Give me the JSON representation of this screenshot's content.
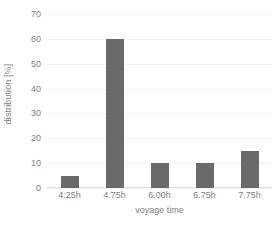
{
  "chart_data": {
    "type": "bar",
    "title": "",
    "subtitle": "",
    "xlabel": "voyage time",
    "ylabel": "distribution [%]",
    "categories": [
      "4.25h",
      "4.75h",
      "6.00h",
      "6.75h",
      "7.75h"
    ],
    "values": [
      5,
      60,
      10,
      10,
      15
    ],
    "ylim": [
      0,
      70
    ],
    "yticks": [
      0,
      10,
      20,
      30,
      40,
      50,
      60,
      70
    ],
    "ytick_labels": [
      "0",
      "10",
      "20",
      "30",
      "40",
      "50",
      "60",
      "70"
    ],
    "grid": true,
    "legend": false,
    "legend_position": "none",
    "series": [
      {
        "name": "distribution",
        "values": [
          5,
          60,
          10,
          10,
          15
        ]
      }
    ],
    "colors": {
      "bar": "#6a6a6a",
      "gridline": "#f0f0f0",
      "axis": "#e2e2e2",
      "text": "#7f7f7f",
      "background": "#ffffff"
    }
  }
}
